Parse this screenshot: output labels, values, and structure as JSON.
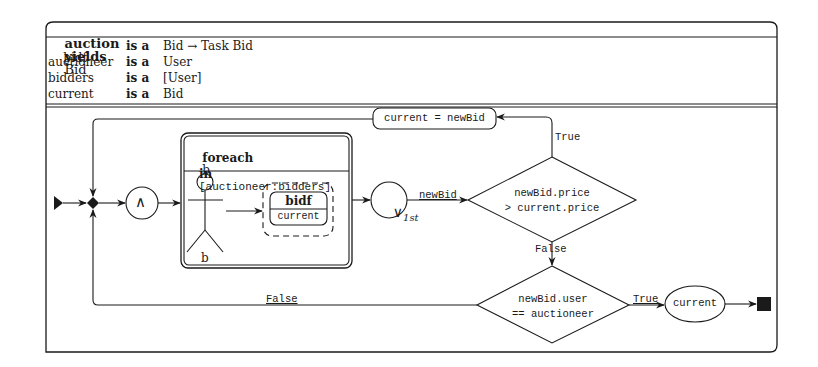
{
  "task": {
    "name": "auction",
    "yields_keyword": "yields",
    "result_type": "Bid",
    "params": [
      {
        "name": "bidf",
        "keyword": "is a",
        "type": "Bid → Task Bid"
      },
      {
        "name": "auctioneer",
        "keyword": "is a",
        "type": "User"
      },
      {
        "name": "bidders",
        "keyword": "is a",
        "type": "[User]"
      },
      {
        "name": "current",
        "keyword": "is a",
        "type": "Bid"
      }
    ]
  },
  "diagram": {
    "and_split": {
      "symbol": "∧"
    },
    "foreach": {
      "keyword": "foreach",
      "var": "b",
      "in_keyword": "in",
      "list": "[auctioneer:bidders]",
      "actor_label": "b",
      "task_name": "bidf",
      "task_arg": "current"
    },
    "or_join": {
      "symbol": "∨",
      "subscript": "1st"
    },
    "edge_newbid": "newBid",
    "decision1": {
      "line1": "newBid.price",
      "line2": "> current.price"
    },
    "decision1_true": "True",
    "decision1_false": "False",
    "assign": "current = newBid",
    "decision2": {
      "line1": "newBid.user",
      "line2": "== auctioneer"
    },
    "decision2_true": "True",
    "decision2_false": "False",
    "result": "current"
  },
  "colors": {
    "stroke": "#1a1a1a",
    "fill": "#ffffff"
  }
}
